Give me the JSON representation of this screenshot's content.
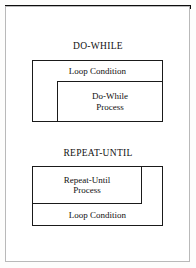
{
  "figure": {
    "background_color": "#ffffff",
    "line_color": "#1a1a1a",
    "rule_color": "#0d0d0d",
    "frame_color": "#b9b9b9"
  },
  "sections": [
    {
      "title": "DO-WHILE",
      "condition_label": "Loop Condition",
      "process_line1": "Do-While",
      "process_line2": "Process",
      "order": "condition-first"
    },
    {
      "title": "REPEAT-UNTIL",
      "condition_label": "Loop Condition",
      "process_line1": "Repeat-Until",
      "process_line2": "Process",
      "order": "process-first"
    }
  ]
}
